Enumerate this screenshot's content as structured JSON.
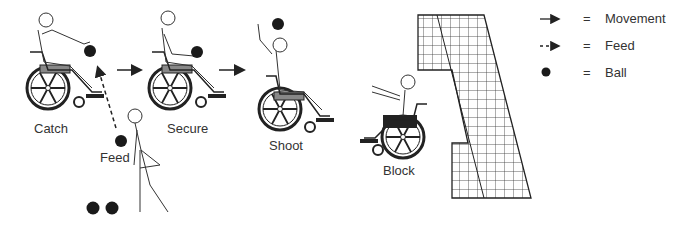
{
  "figure": {
    "labels": {
      "catch": "Catch",
      "secure": "Secure",
      "shoot": "Shoot",
      "block": "Block",
      "feed": "Feed"
    },
    "legend": [
      {
        "symbol": "solid-arrow-icon",
        "equals": "=",
        "label": "Movement"
      },
      {
        "symbol": "dashed-arrow-icon",
        "equals": "=",
        "label": "Feed"
      },
      {
        "symbol": "ball-icon",
        "equals": "=",
        "label": "Ball"
      }
    ],
    "colors": {
      "line": "#222222",
      "ball": "#1a1a1a",
      "seat": "#777777",
      "block_seat": "#222222",
      "background": "#ffffff"
    }
  }
}
